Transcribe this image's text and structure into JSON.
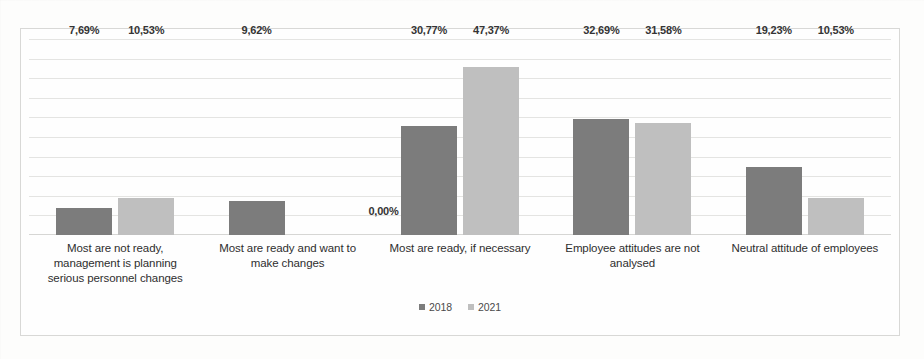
{
  "chart_data": {
    "type": "bar",
    "title": "",
    "subtitle": "",
    "xlabel": "",
    "ylabel": "",
    "ylim": [
      0,
      55
    ],
    "grid": true,
    "gridline_count": 11,
    "legend_position": "bottom-center",
    "value_label_format": "comma-decimal-percent",
    "categories": [
      "Most are not ready, management is planning serious personnel changes",
      "Most are ready and want to make changes",
      "Most are ready, if necessary",
      "Employee attitudes are not analysed",
      "Neutral attitude of employees"
    ],
    "category_lines": [
      [
        "Most are not ready,",
        "management is planning",
        "serious personnel changes"
      ],
      [
        "Most are ready and want to",
        "make changes"
      ],
      [
        "Most are ready, if necessary"
      ],
      [
        "Employee attitudes are not",
        "analysed"
      ],
      [
        "Neutral attitude of employees"
      ]
    ],
    "series": [
      {
        "name": "2018",
        "color": "#7c7c7c",
        "values": [
          7.69,
          9.62,
          30.77,
          32.69,
          19.23
        ],
        "labels": [
          "7,69%",
          "9,62%",
          "30,77%",
          "32,69%",
          "19,23%"
        ]
      },
      {
        "name": "2021",
        "color": "#bfbfbf",
        "values": [
          10.53,
          0.0,
          47.37,
          31.58,
          10.53
        ],
        "labels": [
          "10,53%",
          "0,00%",
          "47,37%",
          "31,58%",
          "10,53%"
        ]
      }
    ]
  },
  "legend": {
    "items": [
      {
        "label": "2018",
        "color": "#7c7c7c"
      },
      {
        "label": "2021",
        "color": "#bfbfbf"
      }
    ]
  },
  "colors": {
    "series_2018": "#7c7c7c",
    "series_2021": "#bfbfbf",
    "gridline": "#dfdfdd",
    "border": "#d8d8d6",
    "background": "#fefefe"
  }
}
